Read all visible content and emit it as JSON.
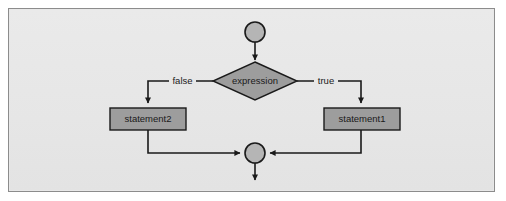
{
  "diagram": {
    "type": "flowchart",
    "background_color": "#e8e8e8",
    "border_color": "#8c8c8c",
    "shape_fill_color": "#9d9d9d",
    "node_circle_color": "#b5b5b5",
    "line_color": "#1a1a1a",
    "nodes": [
      {
        "id": "start",
        "shape": "circle",
        "label": "",
        "cx": 255,
        "cy": 32,
        "r": 10
      },
      {
        "id": "decision",
        "shape": "diamond",
        "label": "expression",
        "cx": 255,
        "cy": 81,
        "rx": 42,
        "ry": 19
      },
      {
        "id": "statement2",
        "shape": "rectangle",
        "label": "statement2",
        "x": 110,
        "y": 108,
        "w": 76,
        "h": 22
      },
      {
        "id": "statement1",
        "shape": "rectangle",
        "label": "statement1",
        "x": 324,
        "y": 108,
        "w": 76,
        "h": 22
      },
      {
        "id": "merge",
        "shape": "circle",
        "label": "",
        "cx": 255,
        "cy": 153,
        "r": 10
      }
    ],
    "edges": [
      {
        "id": "start-to-decision",
        "from": "start",
        "to": "decision",
        "label": ""
      },
      {
        "id": "decision-to-statement2",
        "from": "decision",
        "to": "statement2",
        "label": "false"
      },
      {
        "id": "decision-to-statement1",
        "from": "decision",
        "to": "statement1",
        "label": "true"
      },
      {
        "id": "statement2-to-merge",
        "from": "statement2",
        "to": "merge",
        "label": ""
      },
      {
        "id": "statement1-to-merge",
        "from": "statement1",
        "to": "merge",
        "label": ""
      },
      {
        "id": "merge-to-exit",
        "from": "merge",
        "to": "exit",
        "label": ""
      }
    ],
    "labels": {
      "false_branch": "false",
      "true_branch": "true",
      "decision_text": "expression",
      "statement_left": "statement2",
      "statement_right": "statement1"
    }
  }
}
